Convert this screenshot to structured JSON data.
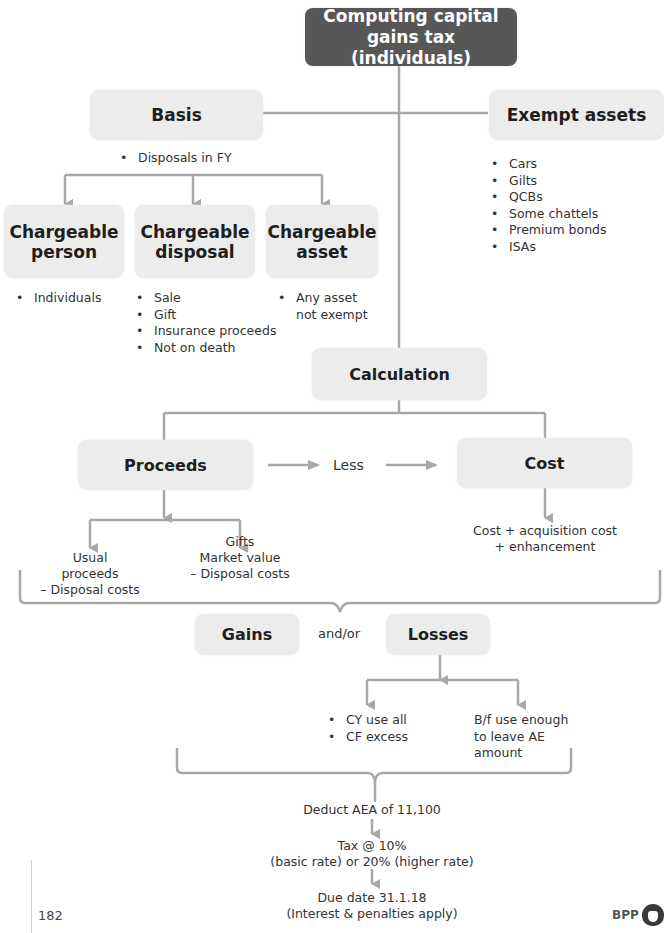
{
  "title": "Computing capital gains tax (individuals)",
  "basis": {
    "label": "Basis",
    "items": [
      "Disposals in FY"
    ]
  },
  "exempt_assets": {
    "label": "Exempt assets",
    "items": [
      "Cars",
      "Gilts",
      "QCBs",
      "Some chattels",
      "Premium bonds",
      "ISAs"
    ]
  },
  "chargeable_person": {
    "label_line1": "Chargeable",
    "label_line2": "person",
    "items": [
      "Individuals"
    ]
  },
  "chargeable_disposal": {
    "label_line1": "Chargeable",
    "label_line2": "disposal",
    "items": [
      "Sale",
      "Gift",
      "Insurance proceeds",
      "Not on death"
    ]
  },
  "chargeable_asset": {
    "label_line1": "Chargeable",
    "label_line2": "asset",
    "items": [
      "Any asset not exempt"
    ]
  },
  "calculation": {
    "label": "Calculation"
  },
  "proceeds": {
    "label": "Proceeds"
  },
  "less_label": "Less",
  "cost": {
    "label": "Cost",
    "detail_line1": "Cost + acquisition cost",
    "detail_line2": "+ enhancement"
  },
  "usual": {
    "line1": "Usual",
    "line2": "proceeds",
    "line3": "– Disposal costs"
  },
  "gifts": {
    "line1": "Gifts",
    "line2": "Market value",
    "line3": "– Disposal costs"
  },
  "gains": {
    "label": "Gains"
  },
  "and_or": "and/or",
  "losses": {
    "label": "Losses",
    "cy_items": [
      "CY use all",
      "CF excess"
    ],
    "bf_line1": "B/f use enough",
    "bf_line2": "to leave AE",
    "bf_line3": "amount"
  },
  "steps": {
    "deduct": "Deduct AEA of 11,100",
    "tax_line1": "Tax @ 10%",
    "tax_line2": "(basic rate) or 20% (higher rate)",
    "due_line1": "Due date 31.1.18",
    "due_line2": "(Interest & penalties apply)"
  },
  "footer": {
    "page_number": "182",
    "brand": "BPP"
  },
  "colors": {
    "title_bg": "#575757",
    "box_bg": "#ececec",
    "line": "#a8a8a8"
  }
}
